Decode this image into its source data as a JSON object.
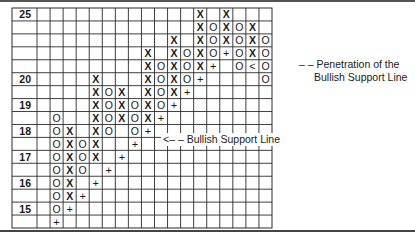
{
  "chart_data": {
    "type": "table",
    "subtype": "point-and-figure",
    "title": "",
    "row_labels": [
      "25",
      "",
      "",
      "",
      "",
      "20",
      "",
      "19",
      "",
      "18",
      "",
      "17",
      "",
      "16",
      "",
      "15",
      ""
    ],
    "column_count": 18,
    "rows": [
      [
        "",
        "",
        "",
        "",
        "",
        "",
        "",
        "",
        "",
        "",
        "",
        "",
        "X",
        "",
        "X",
        "",
        "",
        ""
      ],
      [
        "",
        "",
        "",
        "",
        "",
        "",
        "",
        "",
        "",
        "",
        "",
        "",
        "X",
        "O",
        "X",
        "O",
        "X",
        ""
      ],
      [
        "",
        "",
        "",
        "",
        "",
        "",
        "",
        "",
        "",
        "",
        "X",
        "",
        "X",
        "O",
        "X",
        "O",
        "X",
        "O"
      ],
      [
        "",
        "",
        "",
        "",
        "",
        "",
        "",
        "",
        "X",
        "",
        "X",
        "O",
        "X",
        "O",
        "+",
        "O",
        "X",
        "O"
      ],
      [
        "",
        "",
        "",
        "",
        "",
        "",
        "",
        "",
        "X",
        "O",
        "X",
        "O",
        "X",
        "+",
        "",
        "O",
        "<",
        "O"
      ],
      [
        "",
        "",
        "",
        "",
        "X",
        "",
        "",
        "",
        "X",
        "O",
        "X",
        "O",
        "+",
        "",
        "",
        "",
        "",
        "O"
      ],
      [
        "",
        "",
        "",
        "",
        "X",
        "O",
        "X",
        "",
        "X",
        "O",
        "X",
        "+",
        "",
        "",
        "",
        "",
        "",
        ""
      ],
      [
        "",
        "",
        "",
        "",
        "X",
        "O",
        "X",
        "O",
        "X",
        "O",
        "+",
        "",
        "",
        "",
        "",
        "",
        "",
        ""
      ],
      [
        "",
        "O",
        "",
        "",
        "X",
        "O",
        "X",
        "O",
        "X",
        "+",
        "",
        "",
        "",
        "",
        "",
        "",
        "",
        ""
      ],
      [
        "",
        "O",
        "X",
        "",
        "X",
        "O",
        "",
        "O",
        "+",
        "",
        "",
        "",
        "",
        "",
        "",
        "",
        "",
        ""
      ],
      [
        "",
        "O",
        "X",
        "O",
        "X",
        "",
        "",
        "+",
        "",
        "",
        "",
        "",
        "",
        "",
        "",
        "",
        "",
        ""
      ],
      [
        "",
        "O",
        "X",
        "O",
        "X",
        "",
        "+",
        "",
        "",
        "",
        "",
        "",
        "",
        "",
        "",
        "",
        "",
        ""
      ],
      [
        "",
        "O",
        "X",
        "O",
        "",
        "+",
        "",
        "",
        "",
        "",
        "",
        "",
        "",
        "",
        "",
        "",
        "",
        ""
      ],
      [
        "",
        "O",
        "X",
        "",
        "+",
        "",
        "",
        "",
        "",
        "",
        "",
        "",
        "",
        "",
        "",
        "",
        "",
        ""
      ],
      [
        "",
        "O",
        "X",
        "+",
        "",
        "",
        "",
        "",
        "",
        "",
        "",
        "",
        "",
        "",
        "",
        "",
        "",
        ""
      ],
      [
        "",
        "O",
        "+",
        "",
        "",
        "",
        "",
        "",
        "",
        "",
        "",
        "",
        "",
        "",
        "",
        "",
        "",
        ""
      ],
      [
        "",
        "+",
        "",
        "",
        "",
        "",
        "",
        "",
        "",
        "",
        "",
        "",
        "",
        "",
        "",
        "",
        "",
        ""
      ]
    ],
    "legend": {
      "X": "rising price box",
      "O": "falling price box",
      "+": "bullish support line",
      "<": "penetration point"
    },
    "annotations": [
      {
        "text_line1": "– – Penetration of the",
        "text_line2": "Bullish Support Line",
        "points_to_row": 4,
        "points_to_col": 16
      },
      {
        "text": "<– – Bullish Support Line",
        "row": 10
      }
    ],
    "grid": true
  },
  "colors": {
    "ink": "#1a1a1a",
    "grid": "#2a2a2a",
    "background": "#ffffff"
  }
}
